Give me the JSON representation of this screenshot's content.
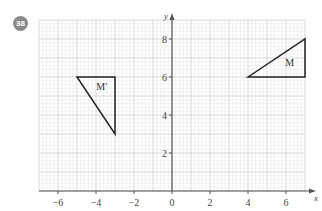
{
  "question": {
    "number": "38"
  },
  "chart_data": {
    "type": "coordinate-grid",
    "title": "",
    "xlabel": "x",
    "ylabel": "y",
    "xlim": [
      -7,
      7
    ],
    "ylim": [
      0,
      9
    ],
    "grid": true,
    "minor_grid_step": 0.2,
    "x_ticks": [
      -6,
      -4,
      -2,
      0,
      2,
      4,
      6
    ],
    "x_tick_labels": [
      "−6",
      "−4",
      "−2",
      "0",
      "2",
      "4",
      "6"
    ],
    "y_ticks": [
      2,
      4,
      6,
      8
    ],
    "y_tick_labels": [
      "2",
      "4",
      "6",
      "8"
    ],
    "shapes": [
      {
        "name": "M",
        "label": "M",
        "vertices": [
          [
            4,
            6
          ],
          [
            7,
            8
          ],
          [
            7,
            6
          ]
        ],
        "label_pos": [
          6.2,
          6.6
        ]
      },
      {
        "name": "M'",
        "label": "M'",
        "vertices": [
          [
            -5,
            6
          ],
          [
            -3,
            6
          ],
          [
            -3,
            3
          ]
        ],
        "label_pos": [
          -3.7,
          5.3
        ]
      }
    ]
  }
}
